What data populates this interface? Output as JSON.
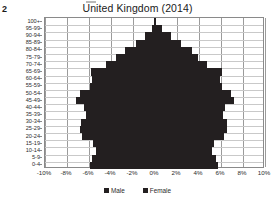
{
  "figure": {
    "number": "2"
  },
  "chart_data": {
    "type": "bar",
    "subtype": "population-pyramid",
    "title": "United Kingdom (2014)",
    "xlabel": "",
    "ylabel": "",
    "orientation": "horizontal-diverging",
    "grid": true,
    "legend_position": "bottom",
    "xlim": [
      -10,
      10
    ],
    "xticks": [
      -10,
      -8,
      -6,
      -4,
      -2,
      0,
      2,
      4,
      6,
      8,
      10
    ],
    "xtick_labels": [
      "-10%",
      "-8%",
      "-6%",
      "-4%",
      "-2%",
      "0%",
      "2%",
      "4%",
      "6%",
      "8%",
      "10%"
    ],
    "categories": [
      "0-4",
      "5-9",
      "10-14",
      "15-19",
      "20-24",
      "25-29",
      "30-34",
      "35-39",
      "40-44",
      "45-49",
      "50-54",
      "55-59",
      "60-64",
      "65-69",
      "70-74",
      "75-79",
      "80-84",
      "85-89",
      "90-94",
      "95-99",
      "100+"
    ],
    "series": [
      {
        "name": "Male",
        "color": "#231f20",
        "side": "left",
        "values": [
          5.95,
          5.75,
          5.35,
          5.65,
          6.65,
          6.85,
          6.75,
          6.3,
          6.45,
          7.2,
          6.85,
          5.95,
          5.75,
          5.85,
          4.45,
          3.55,
          2.75,
          1.75,
          0.9,
          0.3,
          0.05
        ]
      },
      {
        "name": "Female",
        "color": "#231f20",
        "side": "right",
        "values": [
          5.75,
          5.55,
          5.15,
          5.35,
          6.25,
          6.55,
          6.55,
          6.15,
          6.35,
          7.2,
          6.95,
          6.1,
          5.95,
          6.1,
          4.75,
          3.95,
          3.35,
          2.4,
          1.45,
          0.6,
          0.1
        ]
      }
    ]
  },
  "legend": {
    "items": [
      {
        "label": "Male",
        "color": "#231f20"
      },
      {
        "label": "Female",
        "color": "#231f20"
      }
    ]
  }
}
